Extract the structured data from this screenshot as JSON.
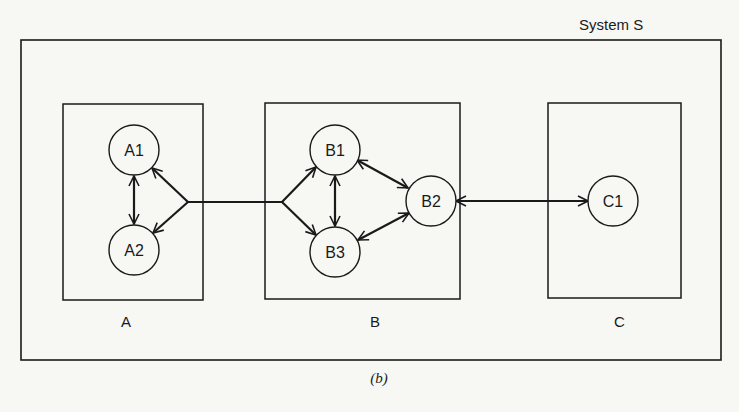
{
  "figure": {
    "system_label": "System S",
    "caption": "(b)",
    "subsystems": [
      {
        "id": "A",
        "label": "A",
        "nodes": [
          "A1",
          "A2"
        ]
      },
      {
        "id": "B",
        "label": "B",
        "nodes": [
          "B1",
          "B2",
          "B3"
        ]
      },
      {
        "id": "C",
        "label": "C",
        "nodes": [
          "C1"
        ]
      }
    ],
    "nodes": {
      "A1": "A1",
      "A2": "A2",
      "B1": "B1",
      "B2": "B2",
      "B3": "B3",
      "C1": "C1"
    },
    "edges": [
      {
        "from": "A1",
        "to": "A2",
        "type": "bidirectional"
      },
      {
        "from": "A-junction",
        "to": "A1",
        "type": "directed"
      },
      {
        "from": "A-junction",
        "to": "A2",
        "type": "directed"
      },
      {
        "from": "A-junction",
        "to": "B-junction",
        "type": "line"
      },
      {
        "from": "B-junction",
        "to": "B1",
        "type": "directed"
      },
      {
        "from": "B-junction",
        "to": "B3",
        "type": "directed"
      },
      {
        "from": "B1",
        "to": "B3",
        "type": "bidirectional"
      },
      {
        "from": "B1",
        "to": "B2",
        "type": "bidirectional"
      },
      {
        "from": "B3",
        "to": "B2",
        "type": "bidirectional"
      },
      {
        "from": "B2",
        "to": "C1",
        "type": "bidirectional"
      }
    ],
    "colors": {
      "stroke": "#1a1a1a",
      "background": "#f7f7f4"
    }
  }
}
